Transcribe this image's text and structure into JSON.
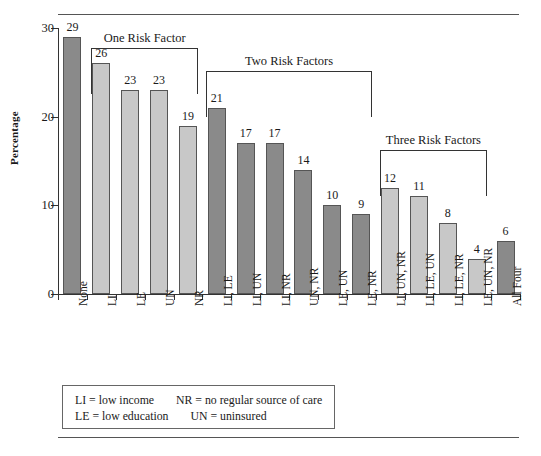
{
  "figure": {
    "y_axis_title": "Percentage",
    "y_ticks": [
      0,
      10,
      20,
      30
    ],
    "top_rule": "horizontal-rule",
    "bottom_rule": "horizontal-rule"
  },
  "brackets": [
    {
      "label": "One Risk Factor",
      "start_index": 1,
      "end_index": 4,
      "top_value": 27.8
    },
    {
      "label": "Two Risk Factors",
      "start_index": 5,
      "end_index": 10,
      "top_value": 25.2
    },
    {
      "label": "Three Risk Factors",
      "start_index": 11,
      "end_index": 14,
      "top_value": 16.2
    }
  ],
  "legend": {
    "row1": {
      "a_key": "LI",
      "a_sep": "=",
      "a_text": "low income",
      "b_key": "NR",
      "b_sep": "=",
      "b_text": "no regular source of care"
    },
    "row2": {
      "a_key": "LE",
      "a_sep": "=",
      "a_text": "low education",
      "b_key": "UN",
      "b_sep": "=",
      "b_text": "uninsured"
    },
    "line1": "LI = low income      NR = no regular source of care",
    "line2": "LE = low education    UN = uninsured"
  },
  "chart_data": {
    "type": "bar",
    "title": "",
    "xlabel": "",
    "ylabel": "Percentage",
    "ylim": [
      0,
      30
    ],
    "yticks": [
      0,
      10,
      20,
      30
    ],
    "grid": false,
    "legend_position": "below-plot-box",
    "categories": [
      "None",
      "LI",
      "LE",
      "UN",
      "NR",
      "LI, LE",
      "LI, UN",
      "LI, NR",
      "UN, NR",
      "LE, UN",
      "LE, NR",
      "LI, UN, NR",
      "LI, LE, UN",
      "LI, LE, NR",
      "LE, UN, NR",
      "All Four"
    ],
    "values": [
      29,
      26,
      23,
      23,
      19,
      21,
      17,
      17,
      14,
      10,
      9,
      12,
      11,
      8,
      4,
      6
    ],
    "bar_shades": [
      "dark",
      "light",
      "light",
      "light",
      "light",
      "dark",
      "dark",
      "dark",
      "dark",
      "dark",
      "dark",
      "light",
      "light",
      "light",
      "light",
      "dark"
    ],
    "colors": {
      "dark": "#8a8a8a",
      "light": "#c8c8c8",
      "edge": "#555555",
      "text": "#1a1a1a"
    },
    "groups": [
      {
        "name": "No Risk Factor",
        "categories": [
          "None"
        ]
      },
      {
        "name": "One Risk Factor",
        "categories": [
          "LI",
          "LE",
          "UN",
          "NR"
        ]
      },
      {
        "name": "Two Risk Factors",
        "categories": [
          "LI, LE",
          "LI, UN",
          "LI, NR",
          "UN, NR",
          "LE, UN",
          "LE, NR"
        ]
      },
      {
        "name": "Three Risk Factors",
        "categories": [
          "LI, UN, NR",
          "LI, LE, UN",
          "LI, LE, NR",
          "LE, UN, NR"
        ]
      },
      {
        "name": "Four Risk Factors",
        "categories": [
          "All Four"
        ]
      }
    ]
  }
}
